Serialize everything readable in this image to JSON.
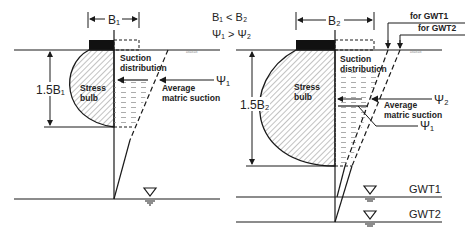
{
  "diagram": {
    "comparison": {
      "width_relation": "B₁ < B₂",
      "suction_relation": "Ψ₁ > Ψ₂"
    },
    "left_panel": {
      "footing_width_label": "B₁",
      "depth_label": "1.5B₁",
      "stress_bulb_label_line1": "Stress",
      "stress_bulb_label_line2": "bulb",
      "suction_label_line1": "Suction",
      "suction_label_line2": "distribution",
      "avg_label_line1": "Average",
      "avg_label_line2": "matric suction",
      "psi_label": "Ψ₁"
    },
    "right_panel": {
      "footing_width_label": "B₂",
      "depth_label": "1.5B₂",
      "stress_bulb_label_line1": "Stress",
      "stress_bulb_label_line2": "bulb",
      "suction_label_line1": "Suction",
      "suction_label_line2": "distribution",
      "avg_label_line1": "Average",
      "avg_label_line2": "matric suction",
      "psi2_label": "Ψ₂",
      "psi1_label": "Ψ₁",
      "gwt1_callout": "for GWT1",
      "gwt2_callout": "for GWT2",
      "gwt1_label": "GWT1",
      "gwt2_label": "GWT2"
    },
    "colors": {
      "line": "#1a1a1a",
      "footing": "#111111",
      "hatch": "#555555"
    }
  }
}
